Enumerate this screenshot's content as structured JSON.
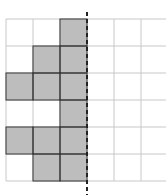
{
  "figure": {
    "rows": 6,
    "cols": 6,
    "cell_size": 27,
    "origin": [
      6,
      19
    ],
    "symmetry_line_col": 3,
    "shaded_cells": [
      [
        0,
        2
      ],
      [
        1,
        1
      ],
      [
        1,
        2
      ],
      [
        2,
        0
      ],
      [
        2,
        1
      ],
      [
        2,
        2
      ],
      [
        3,
        2
      ],
      [
        4,
        0
      ],
      [
        4,
        1
      ],
      [
        4,
        2
      ],
      [
        5,
        1
      ],
      [
        5,
        2
      ]
    ],
    "colors": {
      "grid_line": "#c8c8c8",
      "shade_fill": "#bdbdbd",
      "shade_border": "#333333",
      "symmetry_line": "#222222"
    }
  }
}
